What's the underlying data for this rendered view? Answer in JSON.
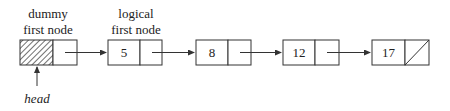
{
  "diagram": {
    "type": "linked-list",
    "labels": {
      "dummy_line1": "dummy",
      "dummy_line2": "first node",
      "logical_line1": "logical",
      "logical_line2": "first node",
      "head": "head"
    },
    "nodes": [
      {
        "id": "dummy",
        "value": "",
        "hatched": true
      },
      {
        "id": "n1",
        "value": "5"
      },
      {
        "id": "n2",
        "value": "8"
      },
      {
        "id": "n3",
        "value": "12"
      },
      {
        "id": "n4",
        "value": "17",
        "null_next": true
      }
    ],
    "colors": {
      "stroke": "#333333",
      "background": "#ffffff"
    }
  }
}
